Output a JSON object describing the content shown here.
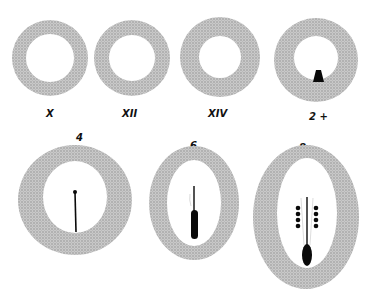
{
  "figure": {
    "colors": {
      "ring": "#bdbdbd",
      "ink": "#0a0a0a",
      "background": "#ffffff"
    },
    "top_row": [
      {
        "label": "X",
        "cx": 50,
        "cy": 58,
        "r_outer": 38,
        "r_inner": 24,
        "content": "empty"
      },
      {
        "label": "XII",
        "cx": 132,
        "cy": 58,
        "r_outer": 38,
        "r_inner": 23,
        "content": "empty"
      },
      {
        "label": "XIV",
        "cx": 220,
        "cy": 57,
        "r_outer": 40,
        "r_inner": 21,
        "content": "empty"
      },
      {
        "label": "2 +",
        "cx": 316,
        "cy": 60,
        "r_outer": 42,
        "r_inner": 22,
        "content": "small-dark-triangle"
      }
    ],
    "bottom_row": [
      {
        "label": "4",
        "content": "thin-line-with-dot"
      },
      {
        "label": "6",
        "content": "line-with-elongated-body"
      },
      {
        "label": "8",
        "content": "line-with-body-and-bead-rows"
      }
    ]
  }
}
